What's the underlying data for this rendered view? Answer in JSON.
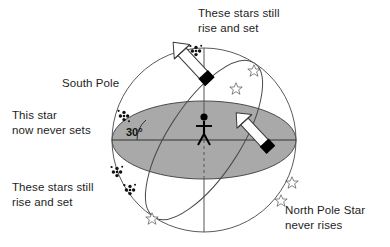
{
  "diagram": {
    "background_color": "#ffffff",
    "labels": {
      "top_right": "These stars still\nrise and set",
      "south_pole": "South Pole",
      "left_star": "This star\nnow never sets",
      "bottom_left": "These stars still\nrise and set",
      "north_pole_star": "North Pole Star\nnever rises",
      "angle": "30°"
    },
    "colors": {
      "horizon_fill": "#a9a9a9",
      "outline": "#555555",
      "ink": "#1a1a1a",
      "arrow_fill": "#ffffff",
      "arrow_tail": "#000000"
    },
    "elements": {
      "sphere": "celestial-sphere-outline",
      "horizon_plane": "horizon-plane-ellipse",
      "celestial_equator": "tilted-equator-ellipse",
      "axis": "vertical-rotation-axis",
      "observer": "stick-figure-observer",
      "angle_marker": "thirty-degree-angle",
      "circumpolar_stars": 4,
      "rising_setting_stars": 6,
      "motion_arrows": 2
    }
  }
}
